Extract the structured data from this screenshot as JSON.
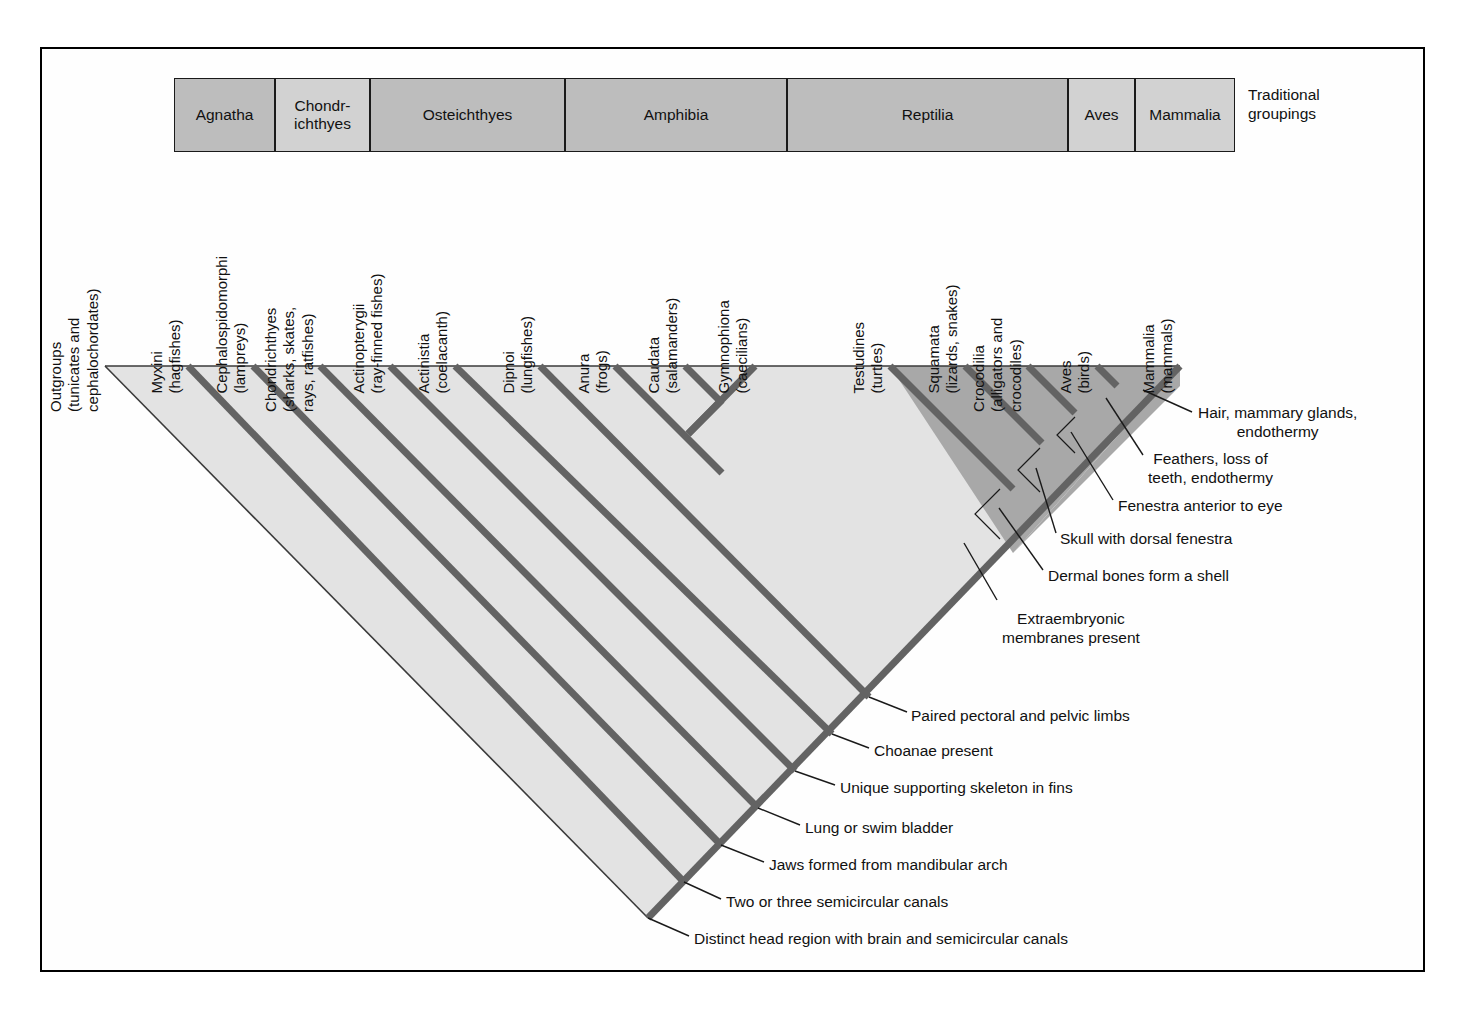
{
  "figure": {
    "traditional_caption_line1": "Traditional",
    "traditional_caption_line2": "groupings"
  },
  "traditional_groupings": [
    {
      "label": "Agnatha",
      "x": 174,
      "w": 101,
      "shade": "med"
    },
    {
      "label": "Chondr-\nichthyes",
      "x": 275,
      "w": 95,
      "shade": "lite"
    },
    {
      "label": "Osteichthyes",
      "x": 370,
      "w": 195,
      "shade": "med"
    },
    {
      "label": "Amphibia",
      "x": 565,
      "w": 222,
      "shade": "med"
    },
    {
      "label": "Reptilia",
      "x": 787,
      "w": 281,
      "shade": "med"
    },
    {
      "label": "Aves",
      "x": 1068,
      "w": 67,
      "shade": "lite"
    },
    {
      "label": "Mammalia",
      "x": 1135,
      "w": 100,
      "shade": "lite"
    }
  ],
  "taxa": [
    {
      "name": "Outgroups",
      "common": "(tunicates and\ncephalochordates)",
      "x": 105
    },
    {
      "name": "Myxini",
      "common": "(hagfishes)",
      "x": 188
    },
    {
      "name": "Cephalospidomorphi",
      "common": "(lampreys)",
      "x": 253
    },
    {
      "name": "Chondrichthyes",
      "common": "(sharks, skates,\nrays, ratfishes)",
      "x": 320
    },
    {
      "name": "Actinopterygii",
      "common": "(ray-finned fishes)",
      "x": 390
    },
    {
      "name": "Actinistia",
      "common": "(coelacanth)",
      "x": 455
    },
    {
      "name": "Dipnoi",
      "common": "(lungfishes)",
      "x": 540
    },
    {
      "name": "Anura",
      "common": "(frogs)",
      "x": 615
    },
    {
      "name": "Caudata",
      "common": "(salamanders)",
      "x": 685
    },
    {
      "name": "Gymnophiona",
      "common": "(caecilians)",
      "x": 755
    },
    {
      "name": "Testudines",
      "common": "(turtles)",
      "x": 890
    },
    {
      "name": "Squamata",
      "common": "(lizards, snakes)",
      "x": 965
    },
    {
      "name": "Crocodilia",
      "common": "(alligators and\ncrocodiles)",
      "x": 1028
    },
    {
      "name": "Aves",
      "common": "(birds)",
      "x": 1097
    },
    {
      "name": "Mammalia",
      "common": "(mammals)",
      "x": 1180
    }
  ],
  "characters": [
    {
      "label": "Hair, mammary glands,\nendothermy",
      "x": 1198,
      "y": 404,
      "align": "left"
    },
    {
      "label": "Feathers, loss of\nteeth, endothermy",
      "x": 1148,
      "y": 450,
      "align": "left"
    },
    {
      "label": "Fenestra anterior to eye",
      "x": 1118,
      "y": 497,
      "align": "left"
    },
    {
      "label": "Skull with dorsal fenestra",
      "x": 1060,
      "y": 530,
      "align": "left"
    },
    {
      "label": "Dermal bones form a shell",
      "x": 1048,
      "y": 567,
      "align": "left"
    },
    {
      "label": "Extraembryonic\nmembranes present",
      "x": 1002,
      "y": 610,
      "align": "left"
    },
    {
      "label": "Paired pectoral and pelvic limbs",
      "x": 911,
      "y": 707,
      "align": "left"
    },
    {
      "label": "Choanae present",
      "x": 874,
      "y": 742,
      "align": "left"
    },
    {
      "label": "Unique supporting skeleton in fins",
      "x": 840,
      "y": 779,
      "align": "left"
    },
    {
      "label": "Lung or swim bladder",
      "x": 805,
      "y": 819,
      "align": "left"
    },
    {
      "label": "Jaws formed from mandibular arch",
      "x": 769,
      "y": 856,
      "align": "left"
    },
    {
      "label": "Two or three semicircular canals",
      "x": 726,
      "y": 893,
      "align": "left"
    },
    {
      "label": "Distinct head region with brain and semicircular canals",
      "x": 694,
      "y": 930,
      "align": "left"
    }
  ],
  "colors": {
    "frame_border": "#000000",
    "branch_line": "#636363",
    "clade_fill_light": "#e3e3e3",
    "clade_fill_dark": "#a8a8a8",
    "grouping_fill_med": "#bdbdbd",
    "grouping_fill_light": "#d2d2d2",
    "text": "#111111",
    "leader_line": "#1a1a1a"
  },
  "chart_data": {
    "type": "diagram",
    "root": {
      "x": 648,
      "y": 918
    },
    "tip_line_y": 366,
    "nodes": [
      {
        "id": "chordata",
        "character": "Distinct head region with brain and semicircular canals",
        "x": 648,
        "y": 918
      },
      {
        "id": "craniata",
        "character": "Two or three semicircular canals",
        "x": 684,
        "y": 882
      },
      {
        "id": "gnathostomata",
        "character": "Jaws formed from mandibular arch",
        "x": 721,
        "y": 845
      },
      {
        "id": "osteichthyes",
        "character": "Lung or swim bladder",
        "x": 758,
        "y": 808
      },
      {
        "id": "sarcopterygii",
        "character": "Unique supporting skeleton in fins",
        "x": 795,
        "y": 771
      },
      {
        "id": "tetrapodomorph",
        "character": "Choanae present",
        "x": 832,
        "y": 734
      },
      {
        "id": "tetrapoda",
        "character": "Paired pectoral and pelvic limbs",
        "x": 869,
        "y": 697
      },
      {
        "id": "amniota",
        "character": "Extraembryonic membranes present",
        "x": 1013,
        "y": 553
      },
      {
        "id": "testudines_cl",
        "character": "Dermal bones form a shell",
        "x": 1000,
        "y": 510
      },
      {
        "id": "diapsida",
        "character": "Skull with dorsal fenestra",
        "x": 1042,
        "y": 468
      },
      {
        "id": "archosauria",
        "character": "Fenestra anterior to eye",
        "x": 1075,
        "y": 430
      },
      {
        "id": "aves_cl",
        "character": "Feathers, loss of teeth, endothermy",
        "x": 1106,
        "y": 398
      },
      {
        "id": "mammalia_cl",
        "character": "Hair, mammary glands, endothermy",
        "x": 1143,
        "y": 390
      }
    ]
  }
}
